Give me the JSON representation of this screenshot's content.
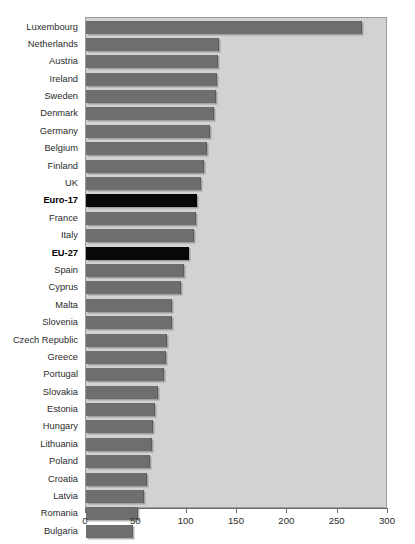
{
  "chart_data": {
    "type": "bar",
    "orientation": "horizontal",
    "title": "",
    "subtitle": "",
    "xlabel": "",
    "ylabel": "",
    "xlim": [
      0,
      300
    ],
    "xticks": [
      0,
      50,
      100,
      150,
      200,
      250,
      300
    ],
    "xtick_labels": [
      "0",
      "50",
      "100",
      "150",
      "200",
      "250",
      "300"
    ],
    "grid": false,
    "legend": "none",
    "categories": [
      "Luxembourg",
      "Netherlands",
      "Austria",
      "Ireland",
      "Sweden",
      "Denmark",
      "Germany",
      "Belgium",
      "Finland",
      "UK",
      "Euro-17",
      "France",
      "Italy",
      "EU-27",
      "Spain",
      "Cyprus",
      "Malta",
      "Slovenia",
      "Czech Republic",
      "Greece",
      "Portugal",
      "Slovakia",
      "Estonia",
      "Hungary",
      "Lithuania",
      "Poland",
      "Croatia",
      "Latvia",
      "Romania",
      "Bulgaria"
    ],
    "values": [
      274,
      132,
      131,
      130,
      129,
      127,
      123,
      120,
      117,
      114,
      110,
      109,
      107,
      102,
      97,
      94,
      85,
      85,
      80,
      79,
      77,
      72,
      69,
      67,
      66,
      64,
      61,
      58,
      52,
      47
    ],
    "highlighted": [
      "Euro-17",
      "EU-27"
    ],
    "colors": {
      "bar": "#6e6e6e",
      "bar_highlight": "#080808",
      "plot_background": "#d2d2d2",
      "plot_border": "#9a9a9a",
      "page_background": "#ffffff",
      "text": "#2b2b2b",
      "axis": "#6b6b6b"
    }
  }
}
